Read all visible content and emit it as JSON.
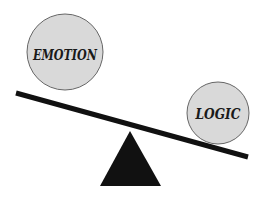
{
  "diagram": {
    "title": "",
    "left_weight": {
      "label": "EMOTION",
      "fill": "#d9d9d9",
      "stroke": "#666666"
    },
    "right_weight": {
      "label": "LOGIC",
      "fill": "#d9d9d9",
      "stroke": "#666666"
    },
    "beam": {
      "color": "#111111"
    },
    "fulcrum": {
      "color": "#111111",
      "shape": "triangle"
    }
  }
}
